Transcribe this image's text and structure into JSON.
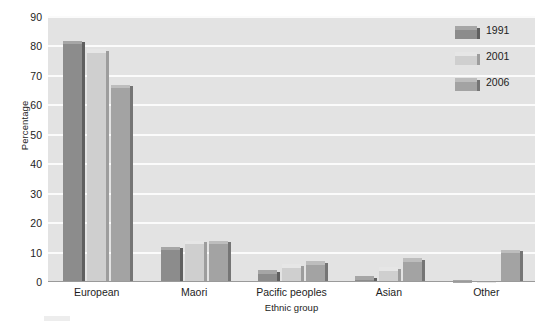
{
  "chart_data": {
    "type": "bar",
    "title": "",
    "xlabel": "Ethnic group",
    "ylabel": "Percentage",
    "ylim": [
      0,
      90
    ],
    "yticks": [
      0,
      10,
      20,
      30,
      40,
      50,
      60,
      70,
      80,
      90
    ],
    "grid": true,
    "legend_position": "top-right",
    "categories": [
      "European",
      "Maori",
      "Pacific peoples",
      "Asian",
      "Other"
    ],
    "series": [
      {
        "name": "1991",
        "color": "#8c8c8c",
        "values": [
          82,
          12,
          4,
          2,
          0.5
        ]
      },
      {
        "name": "2001",
        "color": "#cfcfcf",
        "values": [
          79,
          14,
          6,
          5,
          0.5
        ]
      },
      {
        "name": "2006",
        "color": "#a3a3a3",
        "values": [
          67,
          14,
          7,
          8,
          11
        ]
      }
    ]
  },
  "axes": {
    "ylabel": "Percentage",
    "xlabel": "Ethnic group",
    "ytick_labels": [
      "0",
      "10",
      "20",
      "30",
      "40",
      "50",
      "60",
      "70",
      "80",
      "90"
    ],
    "xtick_labels": [
      "European",
      "Maori",
      "Pacific peoples",
      "Asian",
      "Other"
    ]
  },
  "legend": {
    "items": [
      {
        "label": "1991",
        "swatch_class": "s1991"
      },
      {
        "label": "2001",
        "swatch_class": "s2001"
      },
      {
        "label": "2006",
        "swatch_class": "s2006"
      }
    ]
  }
}
